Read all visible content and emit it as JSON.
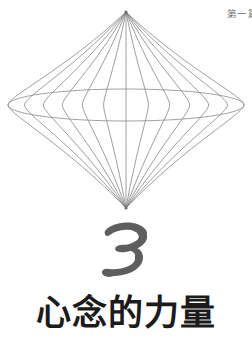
{
  "page": {
    "width": 252,
    "height": 338,
    "background_color": "#ffffff"
  },
  "running_head": {
    "text": "第一篇",
    "color": "#6f6f6f",
    "position": "top-right",
    "clipped": true
  },
  "diagram": {
    "name": "bicone-wireframe",
    "line_color": "#7d7d7d",
    "equator_color": "#8a8a8a",
    "top_apex": {
      "x": 126,
      "y": 12
    },
    "bottom_apex": {
      "x": 126,
      "y": 208
    },
    "equator": {
      "cx": 126,
      "cy": 105,
      "rx": 118,
      "ry": 16
    },
    "meridian_count": 13,
    "meridian_bulge_ratios": [
      -1.0,
      -0.86,
      -0.7,
      -0.54,
      -0.37,
      -0.19,
      0.0,
      0.19,
      0.37,
      0.54,
      0.7,
      0.86,
      1.0
    ]
  },
  "chapter_number": {
    "value": "3",
    "style": "brush-stroke",
    "color": "#5e5e5e"
  },
  "chapter_title": {
    "text": "心念的力量",
    "color": "#1b1b1b"
  }
}
